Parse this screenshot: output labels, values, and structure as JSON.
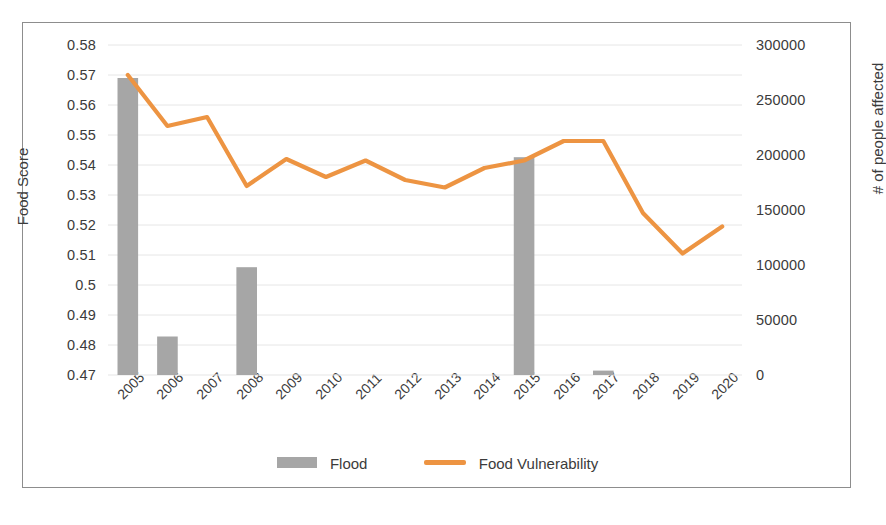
{
  "chart_data": {
    "type": "bar",
    "title": "",
    "xlabel": "",
    "ylabel": "Food Score",
    "y2label": "# of people affected",
    "categories": [
      "2005",
      "2006",
      "2007",
      "2008",
      "2009",
      "2010",
      "2011",
      "2012",
      "2013",
      "2014",
      "2015",
      "2016",
      "2017",
      "2018",
      "2019",
      "2020"
    ],
    "ylim": [
      0.47,
      0.58
    ],
    "y2lim": [
      0,
      300000
    ],
    "yticks": [
      "0.47",
      "0.48",
      "0.49",
      "0.5",
      "0.51",
      "0.52",
      "0.53",
      "0.54",
      "0.55",
      "0.56",
      "0.57",
      "0.58"
    ],
    "y2ticks": [
      "0",
      "50000",
      "100000",
      "150000",
      "200000",
      "250000",
      "300000"
    ],
    "grid": true,
    "legend_position": "bottom",
    "series": [
      {
        "name": "Flood",
        "type": "bar",
        "axis": "right",
        "color": "#a6a6a6",
        "values": [
          270000,
          35000,
          0,
          98000,
          0,
          0,
          0,
          0,
          0,
          0,
          198000,
          0,
          4000,
          0,
          0,
          0
        ]
      },
      {
        "name": "Food Vulnerability",
        "type": "line",
        "axis": "left",
        "color": "#ed9442",
        "values": [
          0.57,
          0.553,
          0.556,
          0.533,
          0.542,
          0.536,
          0.5415,
          0.535,
          0.5325,
          0.539,
          0.5415,
          0.548,
          0.548,
          0.524,
          0.5105,
          0.5195
        ]
      }
    ]
  },
  "legend": {
    "items": [
      {
        "label": "Flood",
        "marker": "bar-swatch",
        "color": "#a6a6a6"
      },
      {
        "label": "Food Vulnerability",
        "marker": "line-swatch",
        "color": "#ed9442"
      }
    ]
  },
  "colors": {
    "bar": "#a6a6a6",
    "line": "#ed9442",
    "grid": "#e6e6e6",
    "frame": "#8d8d8d",
    "text": "#3b3b3b",
    "background": "#ffffff"
  }
}
